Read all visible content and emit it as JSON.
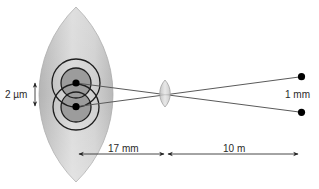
{
  "figure": {
    "type": "optical-resolution-diagram",
    "labels": {
      "image_separation": "2 µm",
      "object_separation": "1 mm",
      "eye_focal_length": "17 mm",
      "object_distance": "10 m"
    },
    "elements": {
      "eye_lens": "large biconvex lens (eye) with two overlapping Airy-disk patterns",
      "pupil_lens": "small biconvex lens at nodal point",
      "object_points": 2,
      "image_points": 2
    },
    "colors": {
      "lens_light": "#dcdcdc",
      "lens_dark": "#b4b4b4",
      "airy_core": "#9c9c9c",
      "ring_stroke": "#1e1e1e",
      "ray": "#5a5a5a",
      "point": "#000000"
    }
  }
}
